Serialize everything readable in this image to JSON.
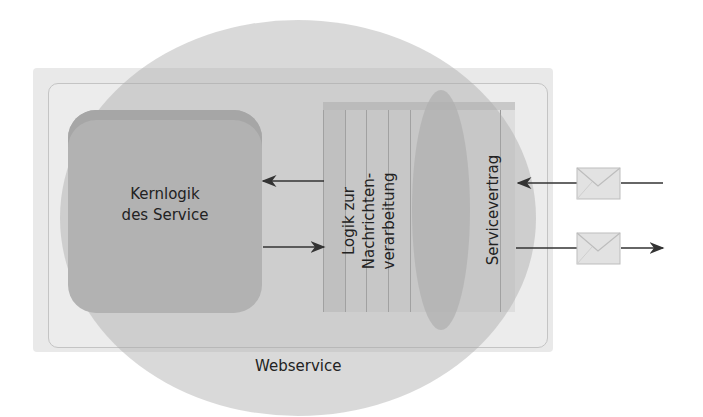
{
  "diagram": {
    "title": "Webservice",
    "core": {
      "label_line1": "Kernlogik",
      "label_line2": "des Service"
    },
    "message_logic": {
      "line1": "Logik zur",
      "line2": "Nachrichten-",
      "line3": "verarbeitung"
    },
    "contract": {
      "label": "Servicevertrag"
    },
    "container_label": "Webservice",
    "arrows": [
      {
        "from": "message_logic",
        "to": "core",
        "direction": "left"
      },
      {
        "from": "core",
        "to": "message_logic",
        "direction": "right"
      },
      {
        "from": "external",
        "to": "contract",
        "direction": "left",
        "carries": "envelope-icon"
      },
      {
        "from": "contract",
        "to": "external",
        "direction": "right",
        "carries": "envelope-icon"
      }
    ],
    "colors": {
      "background": "#ffffff",
      "circle": "#b5b5b5",
      "core": "#b2b2b2",
      "box": "#e9e9e9",
      "text": "#222222"
    }
  }
}
